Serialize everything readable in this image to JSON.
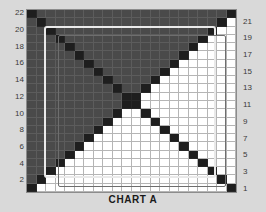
{
  "caption": "CHART A",
  "colors": {
    "background": "#d9d9d9",
    "plot_fill_white": "#ffffff",
    "plot_fill_gray": "#4a4a4a",
    "diagonal_black": "#1e1e1e",
    "gridline": "#787878",
    "frame_light": "#e9e9e9",
    "frame_dark": "#6e6e6e",
    "tick_text": "#3a3a3a"
  },
  "axes": {
    "left": {
      "name": "left-value-axis",
      "ticks": [
        22,
        20,
        18,
        16,
        14,
        12,
        10,
        8,
        6,
        4,
        2
      ]
    },
    "right": {
      "name": "right-value-axis",
      "ticks": [
        21,
        19,
        17,
        15,
        13,
        11,
        9,
        7,
        5,
        3,
        1
      ]
    }
  },
  "chart_data": {
    "type": "heatmap",
    "title": "CHART A",
    "xlabel": "",
    "ylabel": "",
    "grid": true,
    "legend": "none",
    "rows": 22,
    "cols": 22,
    "categories_x": [
      1,
      2,
      3,
      4,
      5,
      6,
      7,
      8,
      9,
      10,
      11,
      12,
      13,
      14,
      15,
      16,
      17,
      18,
      19,
      20,
      21,
      22
    ],
    "categories_y": [
      22,
      21,
      20,
      19,
      18,
      17,
      16,
      15,
      14,
      13,
      12,
      11,
      10,
      9,
      8,
      7,
      6,
      5,
      4,
      3,
      2,
      1
    ],
    "value_legend": {
      "0": "white",
      "1": "gray",
      "2": "black"
    },
    "values": [
      [
        2,
        1,
        1,
        1,
        1,
        1,
        1,
        1,
        1,
        1,
        1,
        1,
        1,
        1,
        1,
        1,
        1,
        1,
        1,
        1,
        1,
        2
      ],
      [
        1,
        2,
        1,
        1,
        1,
        1,
        1,
        1,
        1,
        1,
        1,
        1,
        1,
        1,
        1,
        1,
        1,
        1,
        1,
        1,
        2,
        0
      ],
      [
        1,
        1,
        2,
        1,
        1,
        1,
        1,
        1,
        1,
        1,
        1,
        1,
        1,
        1,
        1,
        1,
        1,
        1,
        1,
        2,
        0,
        0
      ],
      [
        1,
        1,
        1,
        2,
        1,
        1,
        1,
        1,
        1,
        1,
        1,
        1,
        1,
        1,
        1,
        1,
        1,
        1,
        2,
        0,
        0,
        0
      ],
      [
        1,
        1,
        1,
        1,
        2,
        1,
        1,
        1,
        1,
        1,
        1,
        1,
        1,
        1,
        1,
        1,
        1,
        2,
        0,
        0,
        0,
        0
      ],
      [
        1,
        1,
        1,
        1,
        1,
        2,
        1,
        1,
        1,
        1,
        1,
        1,
        1,
        1,
        1,
        1,
        2,
        0,
        0,
        0,
        0,
        0
      ],
      [
        1,
        1,
        1,
        1,
        1,
        1,
        2,
        1,
        1,
        1,
        1,
        1,
        1,
        1,
        1,
        2,
        0,
        0,
        0,
        0,
        0,
        0
      ],
      [
        1,
        1,
        1,
        1,
        1,
        1,
        1,
        2,
        1,
        1,
        1,
        1,
        1,
        1,
        2,
        0,
        0,
        0,
        0,
        0,
        0,
        0
      ],
      [
        1,
        1,
        1,
        1,
        1,
        1,
        1,
        1,
        2,
        1,
        1,
        1,
        1,
        2,
        0,
        0,
        0,
        0,
        0,
        0,
        0,
        0
      ],
      [
        1,
        1,
        1,
        1,
        1,
        1,
        1,
        1,
        1,
        2,
        1,
        1,
        2,
        0,
        0,
        0,
        0,
        0,
        0,
        0,
        0,
        0
      ],
      [
        1,
        1,
        1,
        1,
        1,
        1,
        1,
        1,
        1,
        1,
        2,
        2,
        0,
        0,
        0,
        0,
        0,
        0,
        0,
        0,
        0,
        0
      ],
      [
        1,
        1,
        1,
        1,
        1,
        1,
        1,
        1,
        1,
        1,
        2,
        2,
        0,
        0,
        0,
        0,
        0,
        0,
        0,
        0,
        0,
        0
      ],
      [
        1,
        1,
        1,
        1,
        1,
        1,
        1,
        1,
        1,
        2,
        0,
        0,
        2,
        0,
        0,
        0,
        0,
        0,
        0,
        0,
        0,
        0
      ],
      [
        1,
        1,
        1,
        1,
        1,
        1,
        1,
        1,
        2,
        0,
        0,
        0,
        0,
        2,
        0,
        0,
        0,
        0,
        0,
        0,
        0,
        0
      ],
      [
        1,
        1,
        1,
        1,
        1,
        1,
        1,
        2,
        0,
        0,
        0,
        0,
        0,
        0,
        2,
        0,
        0,
        0,
        0,
        0,
        0,
        0
      ],
      [
        1,
        1,
        1,
        1,
        1,
        1,
        2,
        0,
        0,
        0,
        0,
        0,
        0,
        0,
        0,
        2,
        0,
        0,
        0,
        0,
        0,
        0
      ],
      [
        1,
        1,
        1,
        1,
        1,
        2,
        0,
        0,
        0,
        0,
        0,
        0,
        0,
        0,
        0,
        0,
        2,
        0,
        0,
        0,
        0,
        0
      ],
      [
        1,
        1,
        1,
        1,
        2,
        0,
        0,
        0,
        0,
        0,
        0,
        0,
        0,
        0,
        0,
        0,
        0,
        2,
        0,
        0,
        0,
        0
      ],
      [
        1,
        1,
        1,
        2,
        0,
        0,
        0,
        0,
        0,
        0,
        0,
        0,
        0,
        0,
        0,
        0,
        0,
        0,
        2,
        0,
        0,
        0
      ],
      [
        1,
        1,
        2,
        0,
        0,
        0,
        0,
        0,
        0,
        0,
        0,
        0,
        0,
        0,
        0,
        0,
        0,
        0,
        0,
        2,
        0,
        0
      ],
      [
        1,
        2,
        0,
        0,
        0,
        0,
        0,
        0,
        0,
        0,
        0,
        0,
        0,
        0,
        0,
        0,
        0,
        0,
        0,
        0,
        2,
        0
      ],
      [
        2,
        0,
        0,
        0,
        0,
        0,
        0,
        0,
        0,
        0,
        0,
        0,
        0,
        0,
        0,
        0,
        0,
        0,
        0,
        0,
        0,
        2
      ]
    ]
  }
}
